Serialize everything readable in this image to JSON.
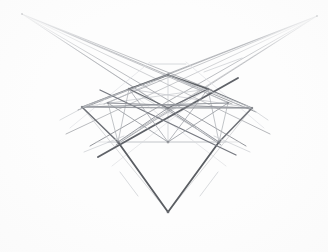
{
  "artwork": {
    "title": "Two-Point Perspective Geometric Construction",
    "medium": "graphite pencil on paper",
    "subject": "perspective cube with construction lines",
    "background_color": "#fdfdfd",
    "canvas": {
      "width": 328,
      "height": 252
    }
  },
  "palette": {
    "graphite_dark": "#55575c",
    "graphite_mid": "#7d8086",
    "graphite_light": "#a8abb0",
    "graphite_faint": "#c8cace",
    "graphite_ghost": "#dcdee1"
  },
  "construction": {
    "vanishing_point_left": {
      "name": "vanishing-point-left",
      "x": 22,
      "y": 14
    },
    "vanishing_point_right": {
      "name": "vanishing-point-right",
      "x": 317,
      "y": 16
    },
    "vertical_axis": {
      "name": "vertical-axis",
      "x": 168,
      "y_top": 11,
      "y_bottom": 229
    },
    "bottom_apex": {
      "name": "bottom-apex",
      "x": 168,
      "y": 212
    },
    "center_node": {
      "name": "center-node",
      "x": 168,
      "y": 108
    }
  },
  "nodes": [
    {
      "id": "n-top",
      "x": 168,
      "y": 75,
      "label": "top-vertex"
    },
    {
      "id": "n-upper-left",
      "x": 129,
      "y": 89,
      "label": "upper-left-vertex"
    },
    {
      "id": "n-upper-right",
      "x": 208,
      "y": 89,
      "label": "upper-right-vertex"
    },
    {
      "id": "n-left",
      "x": 82,
      "y": 107,
      "label": "left-horizon-node"
    },
    {
      "id": "n-mid-left",
      "x": 108,
      "y": 103,
      "label": "mid-left-node"
    },
    {
      "id": "n-center",
      "x": 168,
      "y": 108,
      "label": "center-node"
    },
    {
      "id": "n-mid-right",
      "x": 228,
      "y": 103,
      "label": "mid-right-node"
    },
    {
      "id": "n-right",
      "x": 252,
      "y": 108,
      "label": "right-horizon-node"
    },
    {
      "id": "n-lower-left",
      "x": 118,
      "y": 142,
      "label": "lower-left-vertex"
    },
    {
      "id": "n-bottom-mid",
      "x": 168,
      "y": 142,
      "label": "bottom-mid-node"
    },
    {
      "id": "n-lower-right",
      "x": 219,
      "y": 142,
      "label": "lower-right-vertex"
    },
    {
      "id": "n-apex",
      "x": 168,
      "y": 212,
      "label": "bottom-apex"
    }
  ],
  "edges": {
    "cube_outline": [
      {
        "name": "edge-top-to-upper-left",
        "x1": 168,
        "y1": 75,
        "x2": 129,
        "y2": 89,
        "weight": "dark"
      },
      {
        "name": "edge-top-to-upper-right",
        "x1": 168,
        "y1": 75,
        "x2": 208,
        "y2": 89,
        "weight": "dark"
      },
      {
        "name": "edge-upper-left-to-center",
        "x1": 129,
        "y1": 89,
        "x2": 168,
        "y2": 108,
        "weight": "mid"
      },
      {
        "name": "edge-upper-right-to-center",
        "x1": 208,
        "y1": 89,
        "x2": 168,
        "y2": 108,
        "weight": "mid"
      },
      {
        "name": "edge-upper-left-to-lower-left",
        "x1": 129,
        "y1": 89,
        "x2": 118,
        "y2": 142,
        "weight": "mid"
      },
      {
        "name": "edge-upper-right-to-lower-right",
        "x1": 208,
        "y1": 89,
        "x2": 219,
        "y2": 142,
        "weight": "mid"
      },
      {
        "name": "edge-lower-left-to-bottom-mid",
        "x1": 118,
        "y1": 142,
        "x2": 168,
        "y2": 142,
        "weight": "light"
      },
      {
        "name": "edge-bottom-mid-to-lower-right",
        "x1": 168,
        "y1": 142,
        "x2": 219,
        "y2": 142,
        "weight": "light"
      },
      {
        "name": "edge-lower-left-to-apex",
        "x1": 118,
        "y1": 142,
        "x2": 168,
        "y2": 212,
        "weight": "dark"
      },
      {
        "name": "edge-lower-right-to-apex",
        "x1": 219,
        "y1": 142,
        "x2": 168,
        "y2": 212,
        "weight": "dark"
      }
    ],
    "diagonals": [
      {
        "name": "diagonal-upperleft-to-lowerright",
        "x1": 108,
        "y1": 103,
        "x2": 252,
        "y2": 108,
        "weight": "light"
      },
      {
        "name": "diagonal-center-long-a",
        "x1": 82,
        "y1": 107,
        "x2": 252,
        "y2": 108,
        "weight": "light"
      },
      {
        "name": "diagonal-center-long-b",
        "x1": 108,
        "y1": 155,
        "x2": 240,
        "y2": 75,
        "weight": "dark"
      },
      {
        "name": "diagonal-center-long-c",
        "x1": 228,
        "y1": 155,
        "x2": 96,
        "y2": 75,
        "weight": "mid"
      }
    ]
  },
  "ray_fans": {
    "left_fan_label": "left-vanishing-rays",
    "right_fan_label": "right-vanishing-rays",
    "left_ray_targets": [
      {
        "x": 252,
        "y": 108
      },
      {
        "x": 240,
        "y": 142
      },
      {
        "x": 219,
        "y": 142
      },
      {
        "x": 228,
        "y": 103
      },
      {
        "x": 208,
        "y": 89
      },
      {
        "x": 262,
        "y": 130
      }
    ],
    "right_ray_targets": [
      {
        "x": 82,
        "y": 107
      },
      {
        "x": 96,
        "y": 142
      },
      {
        "x": 118,
        "y": 142
      },
      {
        "x": 108,
        "y": 103
      },
      {
        "x": 129,
        "y": 89
      },
      {
        "x": 72,
        "y": 130
      }
    ]
  },
  "stats": {
    "node_count": "12",
    "vanishing_points": "2",
    "visible_line_count": "≈46"
  }
}
